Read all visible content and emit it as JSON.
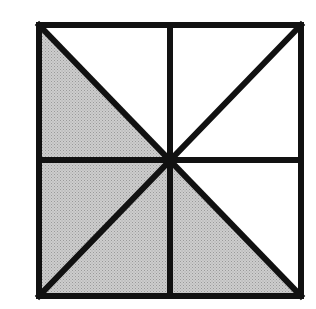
{
  "diagram": {
    "type": "geometric-figure",
    "colors": {
      "background": "#ffffff",
      "stroke": "#111111",
      "shade": "#c6c6c6",
      "shade_dot": "#9a9a9a"
    },
    "square": {
      "x1": 39,
      "y1": 25,
      "x2": 301,
      "y2": 296
    },
    "center": {
      "x": 170,
      "y": 160
    },
    "stroke_width": 6,
    "triangles": [
      {
        "id": "TL-lower",
        "quadrant": "top-left",
        "shaded": true,
        "points": "39,25 39,160 170,160"
      },
      {
        "id": "TL-upper",
        "quadrant": "top-left",
        "shaded": false,
        "points": "39,25 170,25 170,160"
      },
      {
        "id": "TR-upper",
        "quadrant": "top-right",
        "shaded": false,
        "points": "170,25 301,25 170,160"
      },
      {
        "id": "TR-lower",
        "quadrant": "top-right",
        "shaded": false,
        "points": "301,25 301,160 170,160"
      },
      {
        "id": "BL-upper",
        "quadrant": "bottom-left",
        "shaded": true,
        "points": "39,160 170,160 39,296"
      },
      {
        "id": "BL-lower",
        "quadrant": "bottom-left",
        "shaded": true,
        "points": "39,296 170,296 170,160"
      },
      {
        "id": "BR-lower",
        "quadrant": "bottom-right",
        "shaded": true,
        "points": "170,160 170,296 301,296"
      },
      {
        "id": "BR-upper",
        "quadrant": "bottom-right",
        "shaded": false,
        "points": "170,160 301,160 301,296"
      }
    ],
    "shaded_count": 4,
    "total_triangles": 8
  }
}
